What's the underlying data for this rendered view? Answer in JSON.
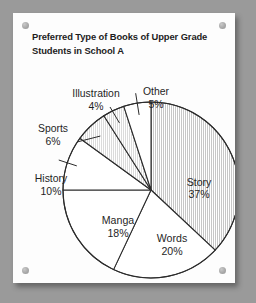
{
  "poster": {
    "title": "Preferred Type of Books of Upper Grade Students in School A",
    "title_line1": "Preferred Type of Books of Upper Grade",
    "title_line2": "Students in School A",
    "pin_names": [
      "top-left",
      "top-right",
      "bottom-left",
      "bottom-right"
    ],
    "background_color": "#9a9a9a",
    "card_color": "#fdfdfd",
    "line_color": "#2b2b2b"
  },
  "chart_data": {
    "type": "pie",
    "title": "Preferred Type of Books of Upper Grade Students in School A",
    "xlabel": "",
    "ylabel": "",
    "units": "percent",
    "total": 100,
    "start_angle_deg": 0,
    "direction": "clockwise",
    "legend": "none",
    "grid": false,
    "categories": [
      "Story",
      "Words",
      "Manga",
      "History",
      "Sports",
      "Illustration",
      "Other"
    ],
    "values": [
      37,
      20,
      18,
      10,
      6,
      4,
      5
    ],
    "slices": [
      {
        "label": "Story",
        "value": 37,
        "value_text": "37%",
        "label_text": "Story",
        "fill": "hatched",
        "label_placement": "inside",
        "label_x": 186,
        "label_y": 173,
        "value_x": 186,
        "value_y": 185
      },
      {
        "label": "Words",
        "value": 20,
        "value_text": "20%",
        "label_text": "Words",
        "fill": "white",
        "label_placement": "inside",
        "label_x": 159,
        "label_y": 229,
        "value_x": 159,
        "value_y": 242
      },
      {
        "label": "Manga",
        "value": 18,
        "value_text": "18%",
        "label_text": "Manga",
        "fill": "white",
        "label_placement": "inside",
        "label_x": 105,
        "label_y": 211,
        "value_x": 105,
        "value_y": 224
      },
      {
        "label": "History",
        "value": 10,
        "value_text": "10%",
        "label_text": "History",
        "fill": "white",
        "label_placement": "outside-left",
        "label_x": 38,
        "label_y": 169,
        "value_x": 38,
        "value_y": 182
      },
      {
        "label": "Sports",
        "value": 6,
        "value_text": "6%",
        "label_text": "Sports",
        "fill": "hatched",
        "label_placement": "outside-left",
        "label_x": 40,
        "label_y": 119,
        "value_x": 40,
        "value_y": 132
      },
      {
        "label": "Illustration",
        "value": 4,
        "value_text": "4%",
        "label_text": "Illustration",
        "fill": "hatched",
        "label_placement": "outside-top-left",
        "label_x": 83,
        "label_y": 84,
        "value_x": 83,
        "value_y": 97
      },
      {
        "label": "Other",
        "value": 5,
        "value_text": "5%",
        "label_text": "Other",
        "fill": "white",
        "label_placement": "outside-top",
        "label_x": 143,
        "label_y": 82,
        "value_x": 143,
        "value_y": 95
      }
    ]
  }
}
